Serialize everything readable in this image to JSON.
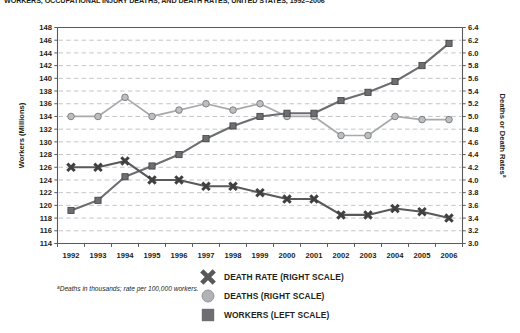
{
  "title": "WORKERS, OCCUPATIONAL INJURY DEATHS, AND DEATH RATES, UNITED STATES, 1992–2006",
  "footnote_marker": "a",
  "footnote": "Deaths in thousands; rate per 100,000 workers.",
  "legend": {
    "items": [
      {
        "label": "DEATH RATE (RIGHT SCALE)",
        "marker": "x-marker-icon",
        "color": "#58595b"
      },
      {
        "label": "DEATHS (RIGHT SCALE)",
        "marker": "circle-marker-icon",
        "color": "#a7a9ac"
      },
      {
        "label": "WORKERS (LEFT SCALE)",
        "marker": "square-marker-icon",
        "color": "#6d6e71"
      }
    ]
  },
  "chart_data": {
    "type": "line",
    "title": "WORKERS, OCCUPATIONAL INJURY DEATHS, AND DEATH RATES, UNITED STATES, 1992–2006",
    "xlabel": "",
    "ylabel": "Workers (Millions)",
    "y2label": "Deaths or Death Rates",
    "y2label_sup": "a",
    "grid": true,
    "legend_position": "bottom-right",
    "categories": [
      1992,
      1993,
      1994,
      1995,
      1996,
      1997,
      1998,
      1999,
      2000,
      2001,
      2002,
      2003,
      2004,
      2005,
      2006
    ],
    "xtick_labels": [
      "1992",
      "1993",
      "1994",
      "1995",
      "1996",
      "1997",
      "1998",
      "1999",
      "2000",
      "2001",
      "2002",
      "2003",
      "2004",
      "2005",
      "2006"
    ],
    "ylim": [
      114,
      148
    ],
    "ytick_labels": [
      "114",
      "116",
      "118",
      "120",
      "122",
      "124",
      "126",
      "128",
      "130",
      "132",
      "134",
      "136",
      "138",
      "140",
      "142",
      "144",
      "146",
      "148"
    ],
    "y2lim": [
      3.0,
      6.4
    ],
    "y2tick_labels": [
      "3.0",
      "3.2",
      "3.4",
      "3.6",
      "3.8",
      "4.0",
      "4.2",
      "4.4",
      "4.6",
      "4.8",
      "5.0",
      "5.2",
      "5.4",
      "5.6",
      "5.8",
      "6.0",
      "6.2",
      "6.4"
    ],
    "series": [
      {
        "name": "WORKERS (LEFT SCALE)",
        "axis": "left",
        "marker": "square",
        "color": "#6d6e71",
        "values": [
          119.2,
          120.8,
          124.5,
          126.2,
          128.0,
          130.5,
          132.5,
          134.0,
          134.5,
          134.5,
          136.5,
          137.8,
          139.5,
          142.0,
          145.5
        ]
      },
      {
        "name": "DEATHS (RIGHT SCALE)",
        "axis": "right",
        "marker": "circle",
        "color": "#a7a9ac",
        "values": [
          5.0,
          5.0,
          5.3,
          5.0,
          5.1,
          5.2,
          5.1,
          5.2,
          5.0,
          5.0,
          4.7,
          4.7,
          5.0,
          4.95,
          4.95
        ]
      },
      {
        "name": "DEATH RATE (RIGHT SCALE)",
        "axis": "right",
        "marker": "x",
        "color": "#58595b",
        "values": [
          4.2,
          4.2,
          4.3,
          4.0,
          4.0,
          3.9,
          3.9,
          3.8,
          3.7,
          3.7,
          3.45,
          3.45,
          3.55,
          3.5,
          3.4
        ]
      }
    ]
  }
}
